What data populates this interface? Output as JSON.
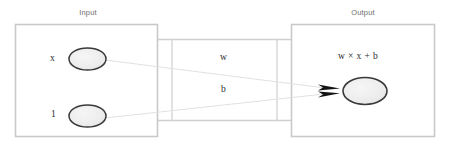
{
  "diagram": {
    "background_color": "#ffffff",
    "box_border_color": "#c9c9c9",
    "node_border_color": "#3a3a3a",
    "node_fill_color": "#ececec",
    "connector_color": "#cfcfcf",
    "edge_line_color": "#e0dedd",
    "arrow_color": "#1a1a1a",
    "caption_color": "#6f6f6f",
    "label_color": "#2b2b2b"
  },
  "input_panel": {
    "caption": "Input",
    "nodes": [
      {
        "label": "x",
        "name": "input-node-x"
      },
      {
        "label": "1",
        "name": "input-node-one"
      }
    ]
  },
  "connector": {
    "weight_label": "w",
    "bias_label": "b"
  },
  "output_panel": {
    "caption": "Output",
    "formula": "w × x + b",
    "node_name": "output-node"
  }
}
